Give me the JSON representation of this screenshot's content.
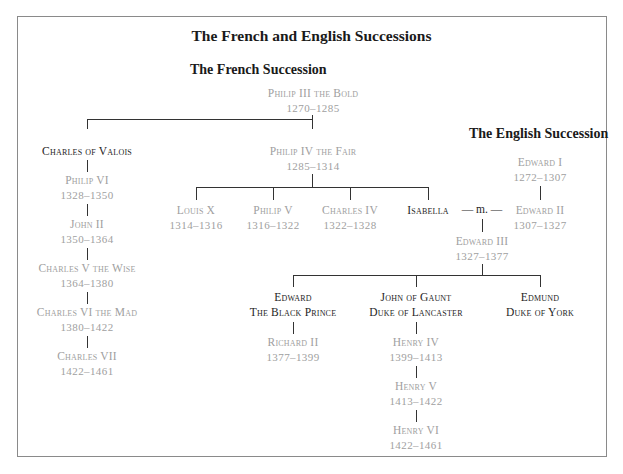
{
  "title": "The French and English Successions",
  "french": {
    "heading": "The French Succession",
    "root": {
      "name": "Philip III the Bold",
      "years": "1270–1285"
    },
    "valois_branch": {
      "founder": {
        "name": "Charles of Valois"
      },
      "line": [
        {
          "name": "Philip VI",
          "years": "1328–1350"
        },
        {
          "name": "John II",
          "years": "1350–1364"
        },
        {
          "name": "Charles V the Wise",
          "years": "1364–1380"
        },
        {
          "name": "Charles VI the Mad",
          "years": "1380–1422"
        },
        {
          "name": "Charles VII",
          "years": "1422–1461"
        }
      ]
    },
    "capet_branch": {
      "king": {
        "name": "Philip IV the Fair",
        "years": "1285–1314"
      },
      "children": [
        {
          "name": "Louis X",
          "years": "1314–1316"
        },
        {
          "name": "Philip V",
          "years": "1316–1322"
        },
        {
          "name": "Charles IV",
          "years": "1322–1328"
        },
        {
          "name": "Isabella"
        }
      ]
    }
  },
  "english": {
    "heading": "The English Succession",
    "edward1": {
      "name": "Edward I",
      "years": "1272–1307"
    },
    "edward2": {
      "name": "Edward II",
      "years": "1307–1327"
    },
    "marriage_label": "— m. —",
    "edward3": {
      "name": "Edward III",
      "years": "1327–1377"
    },
    "sons": [
      {
        "name_line1": "Edward",
        "name_line2": "The Black Prince"
      },
      {
        "name_line1": "John of Gaunt",
        "name_line2": "Duke of Lancaster"
      },
      {
        "name_line1": "Edmund",
        "name_line2": "Duke of York"
      }
    ],
    "black_prince_line": [
      {
        "name": "Richard II",
        "years": "1377–1399"
      }
    ],
    "lancaster_line": [
      {
        "name": "Henry IV",
        "years": "1399–1413"
      },
      {
        "name": "Henry V",
        "years": "1413–1422"
      },
      {
        "name": "Henry VI",
        "years": "1422–1461"
      }
    ]
  },
  "colors": {
    "ruler_text": "#a0a0a0",
    "non_ruler_text": "#1e1e1e",
    "lines": "#333333",
    "frame": "#8a8a8a"
  }
}
